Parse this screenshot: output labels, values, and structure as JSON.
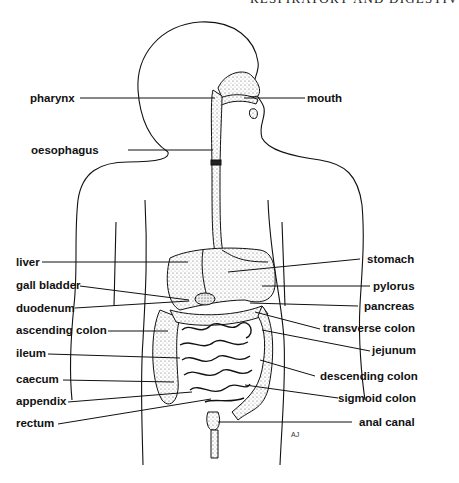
{
  "header": {
    "running_title": "RESPIRATORY AND DIGESTIV"
  },
  "diagram": {
    "labels_left": [
      {
        "id": "pharynx",
        "text": "pharynx"
      },
      {
        "id": "oesophagus",
        "text": "oesophagus"
      },
      {
        "id": "liver",
        "text": "liver"
      },
      {
        "id": "gall_bladder",
        "text": "gall bladder"
      },
      {
        "id": "duodenum",
        "text": "duodenum"
      },
      {
        "id": "ascending_colon",
        "text": "ascending colon"
      },
      {
        "id": "ileum",
        "text": "ileum"
      },
      {
        "id": "caecum",
        "text": "caecum"
      },
      {
        "id": "appendix",
        "text": "appendix"
      },
      {
        "id": "rectum",
        "text": "rectum"
      }
    ],
    "labels_right": [
      {
        "id": "mouth",
        "text": "mouth"
      },
      {
        "id": "stomach",
        "text": "stomach"
      },
      {
        "id": "pylorus",
        "text": "pylorus"
      },
      {
        "id": "pancreas",
        "text": "pancreas"
      },
      {
        "id": "transverse_colon",
        "text": "transverse colon"
      },
      {
        "id": "jejunum",
        "text": "jejunum"
      },
      {
        "id": "descending_colon",
        "text": "descending colon"
      },
      {
        "id": "sigmoid_colon",
        "text": "sigmoid colon"
      },
      {
        "id": "anal_canal",
        "text": "anal canal"
      }
    ],
    "artist_signature": "AJ"
  }
}
